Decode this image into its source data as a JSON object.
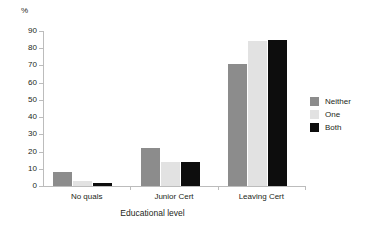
{
  "chart_data": {
    "type": "bar",
    "title": "",
    "subtitle": "",
    "xlabel": "Educational level",
    "ylabel": "%",
    "categories": [
      "No quals",
      "Junior Cert",
      "Leaving Cert"
    ],
    "series": [
      {
        "name": "Neither",
        "color": "#8c8c8c",
        "values": [
          8,
          22,
          71
        ]
      },
      {
        "name": "One",
        "color": "#e2e2e2",
        "values": [
          3,
          14,
          84
        ]
      },
      {
        "name": "Both",
        "color": "#0d0d0d",
        "values": [
          2,
          14,
          85
        ]
      }
    ],
    "ylim": [
      0,
      90
    ],
    "ytick_labels": [
      "90",
      "80",
      "70",
      "60",
      "50",
      "40",
      "30",
      "20",
      "10",
      "0"
    ],
    "ytick_values": [
      90,
      80,
      70,
      60,
      50,
      40,
      30,
      20,
      10,
      0
    ],
    "grid": false,
    "legend_position": "right"
  },
  "axis": {
    "unit_label": "%",
    "x_title": "Educational level"
  },
  "legend": {
    "entries": [
      {
        "label": "Neither",
        "swatch": "neither"
      },
      {
        "label": "One",
        "swatch": "one"
      },
      {
        "label": "Both",
        "swatch": "both"
      }
    ]
  }
}
